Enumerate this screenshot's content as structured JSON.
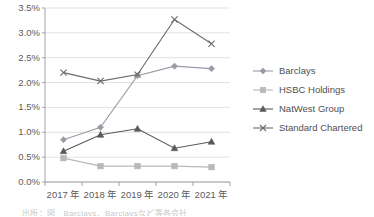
{
  "chart_data": {
    "type": "line",
    "title": "",
    "xlabel": "",
    "ylabel": "",
    "categories": [
      "2017 年",
      "2018 年",
      "2019 年",
      "2020 年",
      "2021 年"
    ],
    "ylim": [
      0.0,
      3.5
    ],
    "ytick_labels": [
      "0.0%",
      "0.5%",
      "1.0%",
      "1.5%",
      "2.0%",
      "2.5%",
      "3.0%",
      "3.5%"
    ],
    "ytick_values": [
      0.0,
      0.5,
      1.0,
      1.5,
      2.0,
      2.5,
      3.0,
      3.5
    ],
    "grid": true,
    "legend_position": "right",
    "series": [
      {
        "name": "Barclays",
        "marker": "diamond",
        "color": "#9a9aa6",
        "values": [
          0.85,
          1.1,
          2.14,
          2.33,
          2.28
        ]
      },
      {
        "name": "HSBC Holdings",
        "marker": "square",
        "color": "#b9b9b9",
        "values": [
          0.48,
          0.32,
          0.32,
          0.32,
          0.3
        ]
      },
      {
        "name": "NatWest Group",
        "marker": "triangle",
        "color": "#5a5a5a",
        "values": [
          0.62,
          0.95,
          1.07,
          0.68,
          0.81
        ]
      },
      {
        "name": "Standard Chartered",
        "marker": "cross",
        "color": "#6b6b6b",
        "values": [
          2.2,
          2.03,
          2.16,
          3.27,
          2.78
        ]
      }
    ]
  },
  "legend": {
    "items": [
      {
        "label": "Barclays"
      },
      {
        "label": "HSBC Holdings"
      },
      {
        "label": "NatWest Group"
      },
      {
        "label": "Standard Chartered"
      }
    ]
  },
  "source_caption": "出所：図　Barclays、Barclaysなど等各会社"
}
